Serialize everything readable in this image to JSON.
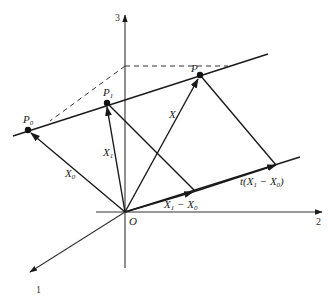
{
  "diagram": {
    "type": "vector-geometry",
    "axes": [
      {
        "name": "axis-1",
        "label": "1"
      },
      {
        "name": "axis-2",
        "label": "2"
      },
      {
        "name": "axis-3",
        "label": "3"
      }
    ],
    "origin_label": "O",
    "points": [
      {
        "name": "P0",
        "label": "P",
        "sub": "0"
      },
      {
        "name": "P1",
        "label": "P",
        "sub": "1"
      },
      {
        "name": "P",
        "label": "P",
        "sub": ""
      }
    ],
    "vectors": [
      {
        "name": "X0",
        "label": "X",
        "sub": "0"
      },
      {
        "name": "X1",
        "label": "X",
        "sub": "1"
      },
      {
        "name": "X",
        "label": "X",
        "sub": ""
      },
      {
        "name": "X1-X0",
        "label": "X",
        "sub": "1",
        "rest": " − X",
        "sub2": "0"
      },
      {
        "name": "t(X1-X0)",
        "prefix": "t(X",
        "sub": "1",
        "rest": " − X",
        "sub2": "0",
        "suffix": ")"
      }
    ],
    "colors": {
      "stroke": "#1a1a1a",
      "background": "#ffffff"
    }
  }
}
